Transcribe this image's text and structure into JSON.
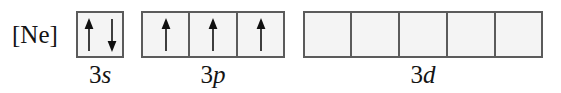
{
  "figure": {
    "type": "orbital-box-diagram",
    "core_label": "[Ne]",
    "colors": {
      "background": "#ffffff",
      "box_fill": "#f4f4f4",
      "box_border": "#5b5b5b",
      "text": "#141414",
      "arrow": "#101010"
    }
  },
  "subshells": [
    {
      "id": "3s",
      "label_n": "3",
      "label_l": "s",
      "label_full": "3s",
      "box_count": 1,
      "boxes": [
        {
          "electrons": [
            "up",
            "down"
          ],
          "electron_count": 2
        }
      ]
    },
    {
      "id": "3p",
      "label_n": "3",
      "label_l": "p",
      "label_full": "3p",
      "box_count": 3,
      "boxes": [
        {
          "electrons": [
            "up"
          ],
          "electron_count": 1
        },
        {
          "electrons": [
            "up"
          ],
          "electron_count": 1
        },
        {
          "electrons": [
            "up"
          ],
          "electron_count": 1
        }
      ]
    },
    {
      "id": "3d",
      "label_n": "3",
      "label_l": "d",
      "label_full": "3d",
      "box_count": 5,
      "boxes": [
        {
          "electrons": [],
          "electron_count": 0
        },
        {
          "electrons": [],
          "electron_count": 0
        },
        {
          "electrons": [],
          "electron_count": 0
        },
        {
          "electrons": [],
          "electron_count": 0
        },
        {
          "electrons": [],
          "electron_count": 0
        }
      ]
    }
  ]
}
